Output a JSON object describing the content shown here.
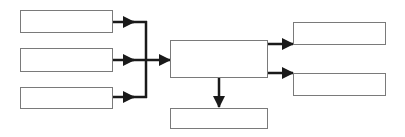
{
  "diagram": {
    "type": "flowchart",
    "colors": {
      "background": "#ffffff",
      "box_border": "#7a7a7a",
      "arrow": "#1a1a1a"
    },
    "nodes": [
      {
        "id": "input-1",
        "label": "",
        "x": 20,
        "y": 10,
        "w": 93,
        "h": 23
      },
      {
        "id": "input-2",
        "label": "",
        "x": 20,
        "y": 48,
        "w": 93,
        "h": 24
      },
      {
        "id": "input-3",
        "label": "",
        "x": 20,
        "y": 87,
        "w": 93,
        "h": 22
      },
      {
        "id": "process",
        "label": "",
        "x": 170,
        "y": 40,
        "w": 98,
        "h": 38
      },
      {
        "id": "output-1",
        "label": "",
        "x": 293,
        "y": 22,
        "w": 93,
        "h": 23
      },
      {
        "id": "output-2",
        "label": "",
        "x": 293,
        "y": 73,
        "w": 93,
        "h": 23
      },
      {
        "id": "output-3",
        "label": "",
        "x": 170,
        "y": 108,
        "w": 98,
        "h": 21
      }
    ],
    "edges": [
      {
        "from": "input-1",
        "to": "process"
      },
      {
        "from": "input-2",
        "to": "process"
      },
      {
        "from": "input-3",
        "to": "process"
      },
      {
        "from": "process",
        "to": "output-1"
      },
      {
        "from": "process",
        "to": "output-2"
      },
      {
        "from": "process",
        "to": "output-3"
      }
    ]
  }
}
